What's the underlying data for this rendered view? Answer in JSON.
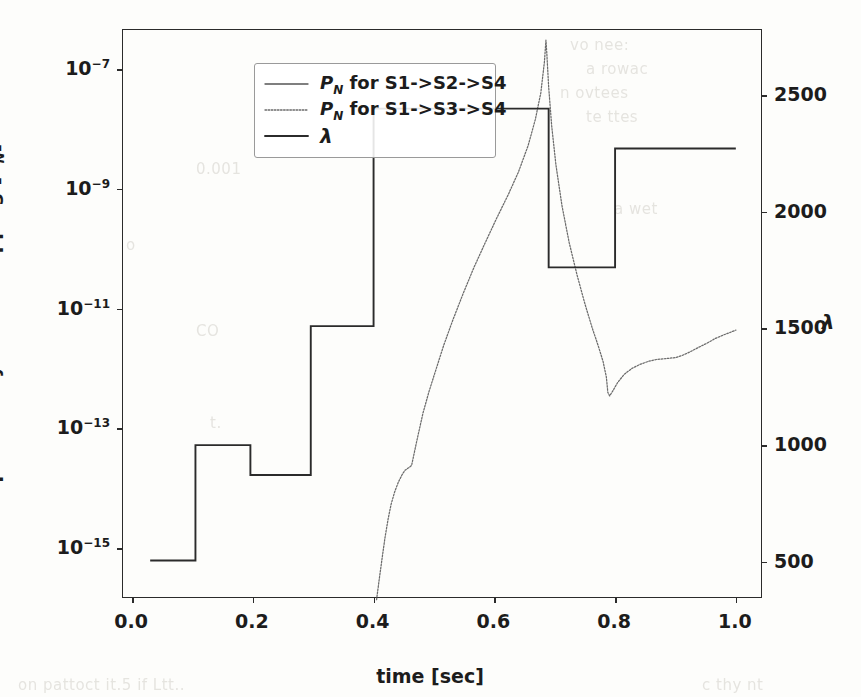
{
  "chart_data": {
    "type": "line",
    "title": "",
    "xlabel": "time [sec]",
    "ylabel_left": "probability of tail dropping [P_N]",
    "ylabel_right": "λ",
    "xlim": [
      -0.015,
      1.045
    ],
    "xticks": [
      "0.0",
      "0.2",
      "0.4",
      "0.6",
      "0.8",
      "1.0"
    ],
    "xtick_values": [
      0.0,
      0.2,
      0.4,
      0.6,
      0.8,
      1.0
    ],
    "ylim_left_log10": [
      -15.85,
      -6.35
    ],
    "yticks_left_mantissa": [
      "10",
      "10",
      "10",
      "10",
      "10"
    ],
    "yticks_left_exponent": [
      "−15",
      "−13",
      "−11",
      "−9",
      "−7"
    ],
    "ytick_left_values_log10": [
      -15,
      -13,
      -11,
      -9,
      -7
    ],
    "ylim_right": [
      340,
      2780
    ],
    "yticks_right": [
      "500",
      "1000",
      "1500",
      "2000",
      "2500"
    ],
    "ytick_right_values": [
      500,
      1000,
      1500,
      2000,
      2500
    ],
    "grid": false,
    "legend_position": "upper left",
    "series": [
      {
        "name": "P_N for S1->S2->S4",
        "label_plain": "P_N for S1->S2->S4",
        "linestyle": "solid",
        "color": "#555555",
        "axis": "left",
        "note": "series present in legend; drawn off visible range within plot bounds",
        "points": []
      },
      {
        "name": "P_N for S1->S3->S4",
        "label_plain": "P_N for S1->S3->S4",
        "linestyle": "dotted",
        "color": "#6b6b6b",
        "axis": "left",
        "x": [
          0.405,
          0.409,
          0.414,
          0.419,
          0.424,
          0.429,
          0.435,
          0.441,
          0.447,
          0.452,
          0.458,
          0.463,
          0.468,
          0.474,
          0.482,
          0.492,
          0.503,
          0.516,
          0.531,
          0.548,
          0.566,
          0.585,
          0.604,
          0.623,
          0.64,
          0.656,
          0.668,
          0.677,
          0.683,
          0.6855,
          0.687,
          0.69,
          0.695,
          0.702,
          0.712,
          0.724,
          0.737,
          0.75,
          0.762,
          0.772,
          0.78,
          0.7855,
          0.788,
          0.791,
          0.796,
          0.804,
          0.815,
          0.828,
          0.842,
          0.856,
          0.869,
          0.88,
          0.89,
          0.9,
          0.912,
          0.925,
          0.938,
          0.952,
          0.966,
          0.98,
          0.993,
          1.0
        ],
        "y_log10": [
          -15.86,
          -15.55,
          -15.18,
          -14.82,
          -14.52,
          -14.27,
          -14.06,
          -13.9,
          -13.78,
          -13.7,
          -13.66,
          -13.62,
          -13.38,
          -13.1,
          -12.74,
          -12.38,
          -12.03,
          -11.62,
          -11.2,
          -10.76,
          -10.32,
          -9.9,
          -9.49,
          -9.1,
          -8.72,
          -8.28,
          -7.84,
          -7.4,
          -6.88,
          -6.52,
          -6.75,
          -7.3,
          -7.95,
          -8.6,
          -9.28,
          -9.9,
          -10.44,
          -10.92,
          -11.32,
          -11.62,
          -11.88,
          -12.14,
          -12.4,
          -12.46,
          -12.38,
          -12.24,
          -12.1,
          -12.0,
          -11.93,
          -11.88,
          -11.85,
          -11.84,
          -11.83,
          -11.82,
          -11.78,
          -11.72,
          -11.65,
          -11.58,
          -11.5,
          -11.44,
          -11.39,
          -11.36
        ],
        "peak": {
          "x": 0.6855,
          "y_log10": -6.52
        },
        "dip": {
          "x": 0.791,
          "y_log10": -12.46
        }
      },
      {
        "name": "λ",
        "label_plain": "lambda",
        "linestyle": "solid",
        "color": "#2b2b2b",
        "axis": "right",
        "step": true,
        "x": [
          0.03,
          0.105,
          0.105,
          0.196,
          0.196,
          0.296,
          0.296,
          0.4,
          0.4,
          0.69,
          0.69,
          0.8,
          0.8,
          1.0
        ],
        "y": [
          505,
          505,
          1000,
          1000,
          872,
          872,
          1510,
          1510,
          2443,
          2443,
          1762,
          1762,
          2272,
          2272
        ]
      }
    ]
  },
  "legend": {
    "items": [
      {
        "prefix": "P",
        "sub": "N",
        "rest": " for S1->S2->S4",
        "style": "solid"
      },
      {
        "prefix": "P",
        "sub": "N",
        "rest": " for S1->S3->S4",
        "style": "dotted"
      },
      {
        "prefix": "λ",
        "sub": "",
        "rest": "",
        "style": "solid"
      }
    ]
  },
  "axis_labels": {
    "x_title_text": "time [sec]",
    "y_left_prefix": "probability of tail dropping [",
    "y_left_italic": "P",
    "y_left_sub": "N",
    "y_left_suffix": "]",
    "y_right_title": "λ"
  },
  "ghost_text": [
    {
      "text": "vo nee:",
      "x": 570,
      "y": 36
    },
    {
      "text": "a rowac",
      "x": 586,
      "y": 60
    },
    {
      "text": "n ovtees",
      "x": 560,
      "y": 84
    },
    {
      "text": "te ttes",
      "x": 586,
      "y": 108
    },
    {
      "text": "0.001",
      "x": 196,
      "y": 160
    },
    {
      "text": "a wet",
      "x": 614,
      "y": 200
    },
    {
      "text": "CO",
      "x": 196,
      "y": 322
    },
    {
      "text": "t.",
      "x": 210,
      "y": 414
    },
    {
      "text": "on  pattoct   it.5 if  Ltt..",
      "x": 18,
      "y": 676
    },
    {
      "text": "c  thy  nt",
      "x": 702,
      "y": 676
    },
    {
      "text": "o",
      "x": 126,
      "y": 236
    }
  ],
  "colors": {
    "background": "#fdfdfb",
    "axis": "#2b2b2b",
    "series_solid_gray": "#555555",
    "series_dotted": "#6b6b6b",
    "series_lambda": "#2b2b2b",
    "text": "#1c1c1c",
    "ghost": "#c9c6bf"
  }
}
